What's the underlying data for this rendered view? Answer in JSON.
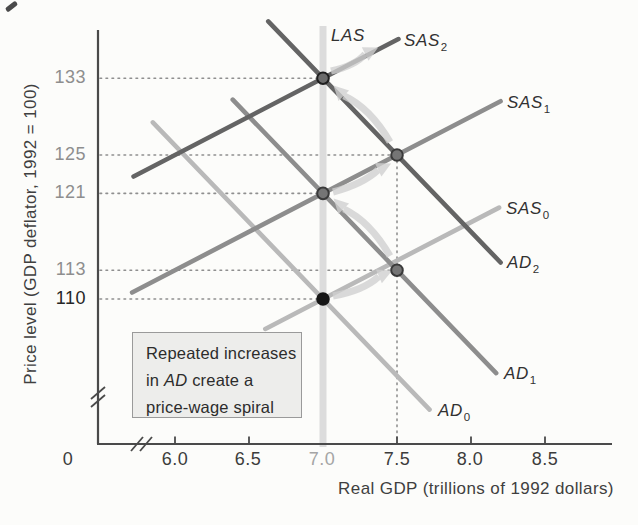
{
  "colors": {
    "background": "#fcfcfa",
    "curve_dark": "#646464",
    "curve_medium": "#8d8d8d",
    "curve_light": "#b9b9b9",
    "las_band": "#dcdcdc",
    "arrow": "#d0d0d0",
    "guide_dotted": "#8f8f8f",
    "axis": "#4a4a4a",
    "dot_black": "#161616",
    "dot_gray_fill": "#757575",
    "dot_gray_ring": "#3a3a3a",
    "dot_ringed_fill": "#6b6b6b",
    "dot_ringed_ring": "#1f1f1f"
  },
  "y_axis": {
    "title": "Price level (GDP deflator, 1992 = 100)",
    "ticks": [
      {
        "label": "133",
        "value": 133
      },
      {
        "label": "125",
        "value": 125
      },
      {
        "label": "121",
        "value": 121
      },
      {
        "label": "113",
        "value": 113
      },
      {
        "label": "110",
        "value": 110
      }
    ]
  },
  "x_axis": {
    "title": "Real GDP (trillions of 1992 dollars)",
    "origin": "0",
    "ticks": [
      {
        "label": "6.0",
        "value": 6.0
      },
      {
        "label": "6.5",
        "value": 6.5
      },
      {
        "label": "7.0",
        "value": 7.0
      },
      {
        "label": "7.5",
        "value": 7.5
      },
      {
        "label": "8.0",
        "value": 8.0
      },
      {
        "label": "8.5",
        "value": 8.5
      }
    ]
  },
  "curve_labels": {
    "las": {
      "text": "LAS"
    },
    "sas2": {
      "text": "SAS",
      "sub": "2"
    },
    "sas1": {
      "text": "SAS",
      "sub": "1"
    },
    "sas0": {
      "text": "SAS",
      "sub": "0"
    },
    "ad2": {
      "text": "AD",
      "sub": "2"
    },
    "ad1": {
      "text": "AD",
      "sub": "1"
    },
    "ad0": {
      "text": "AD",
      "sub": "0"
    }
  },
  "annotation": {
    "line1": "Repeated increases",
    "line2_pre": "in",
    "line2_italic": "AD",
    "line2_post": "create a",
    "line3": "price-wage spiral"
  },
  "chart_data": {
    "type": "line",
    "title": "",
    "xlabel": "Real GDP (trillions of 1992 dollars)",
    "ylabel": "Price level (GDP deflator, 1992 = 100)",
    "x_ticks": [
      6.0,
      6.5,
      7.0,
      7.5,
      8.0,
      8.5
    ],
    "y_ticks": [
      110,
      113,
      121,
      125,
      133
    ],
    "xlim_shown": [
      6.0,
      8.5
    ],
    "ylim_shown": [
      110,
      133
    ],
    "grid": "off",
    "potential_gdp_LAS": 7.0,
    "curves": [
      {
        "id": "AD0",
        "tone": "light",
        "kind": "AD",
        "anchor": [
          7.0,
          110
        ],
        "slope": -16,
        "x_range": [
          5.85,
          7.72
        ]
      },
      {
        "id": "SAS0",
        "tone": "light",
        "kind": "SAS",
        "anchor": [
          7.0,
          110
        ],
        "slope": 8,
        "x_range": [
          6.61,
          8.19
        ]
      },
      {
        "id": "AD1",
        "tone": "medium",
        "kind": "AD",
        "anchor": [
          7.0,
          121
        ],
        "slope": -16,
        "x_range": [
          6.39,
          8.17
        ]
      },
      {
        "id": "SAS1",
        "tone": "medium",
        "kind": "SAS",
        "anchor": [
          7.0,
          121
        ],
        "slope": 8,
        "x_range": [
          5.71,
          8.2
        ]
      },
      {
        "id": "AD2",
        "tone": "dark",
        "kind": "AD",
        "anchor": [
          7.0,
          133
        ],
        "slope": -16,
        "x_range": [
          6.63,
          8.2
        ]
      },
      {
        "id": "SAS2",
        "tone": "dark",
        "kind": "SAS",
        "anchor": [
          7.0,
          133
        ],
        "slope": 8,
        "x_range": [
          5.72,
          7.51
        ]
      }
    ],
    "equilibria": [
      {
        "gdp": 7.0,
        "price": 110,
        "on": "AD0-SAS0",
        "dot": "black"
      },
      {
        "gdp": 7.5,
        "price": 113,
        "on": "AD1-SAS0",
        "dot": "gray"
      },
      {
        "gdp": 7.0,
        "price": 121,
        "on": "AD1-SAS1",
        "dot": "gray"
      },
      {
        "gdp": 7.5,
        "price": 125,
        "on": "AD2-SAS1",
        "dot": "gray"
      },
      {
        "gdp": 7.0,
        "price": 133,
        "on": "AD2-SAS2",
        "dot": "ringed"
      }
    ],
    "guides": {
      "horizontal": [
        {
          "price": 133,
          "x_to": 7.0
        },
        {
          "price": 125,
          "x_to": 7.5
        },
        {
          "price": 121,
          "x_to": 7.0
        },
        {
          "price": 113,
          "x_to": 7.5
        },
        {
          "price": 110,
          "x_to": 7.0
        }
      ],
      "vertical": [
        {
          "gdp": 7.5,
          "price_from": 125
        }
      ]
    },
    "spiral_arrows_px": [
      {
        "from": [
          333,
          296
        ],
        "to": [
          389,
          272
        ],
        "bow": -7
      },
      {
        "from": [
          390,
          256
        ],
        "to": [
          336,
          201
        ],
        "bow": -10
      },
      {
        "from": [
          333,
          192
        ],
        "to": [
          388,
          165
        ],
        "bow": -6
      },
      {
        "from": [
          390,
          142
        ],
        "to": [
          336,
          88
        ],
        "bow": -10
      },
      {
        "from": [
          331,
          71
        ],
        "to": [
          375,
          49
        ],
        "bow": -6
      }
    ]
  }
}
